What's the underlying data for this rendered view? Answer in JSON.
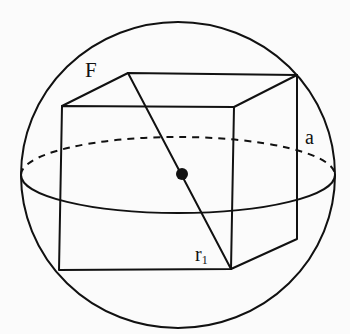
{
  "figure": {
    "colors": {
      "ink": "#111111",
      "background": "#fbfbfb"
    },
    "sphere": {
      "cx": 178,
      "cy": 175,
      "rx": 157,
      "ry": 153
    },
    "equator": {
      "cx": 178,
      "cy": 175,
      "rx": 157,
      "ry": 38,
      "back_half_style": "dashed",
      "front_half_style": "solid"
    },
    "center_point": {
      "x": 182,
      "y": 174,
      "r": 6
    },
    "cube": {
      "front_face": {
        "top_left": [
          62,
          106
        ],
        "top_right": [
          234,
          107
        ],
        "bottom_right": [
          231,
          269
        ],
        "bottom_left": [
          59,
          270
        ]
      },
      "back_face_visible": {
        "top_left": [
          128,
          73
        ],
        "top_right": [
          297,
          75
        ],
        "bottom_right": [
          297,
          239
        ]
      }
    },
    "diagonal": {
      "from": [
        128,
        73
      ],
      "to": [
        231,
        269
      ]
    },
    "labels": {
      "sphere_label": "F",
      "edge_label": "a",
      "radius_label_base": "r",
      "radius_label_sub": "1"
    }
  }
}
